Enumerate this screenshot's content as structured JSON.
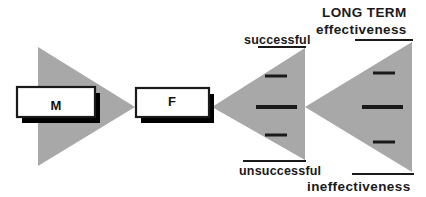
{
  "diagram": {
    "title": "",
    "background_color": "#ffffff",
    "fill_gray": "#a8a8a8",
    "outline_color": "#1a1a1a",
    "shadow_color": "#000000",
    "box_fill": "#ffffff",
    "nodes": [
      {
        "id": "m",
        "label": "M"
      },
      {
        "id": "f",
        "label": "F"
      }
    ],
    "labels": {
      "successful": "successful",
      "unsuccessful": "unsuccessful",
      "long_term": "LONG TERM",
      "effectiveness": "effectiveness",
      "ineffectiveness": "ineffectiveness"
    },
    "triangles": [
      {
        "id": "m-triangle",
        "direction": "right",
        "ticks": 0
      },
      {
        "id": "outcome-triangle",
        "direction": "left",
        "ticks": 3
      },
      {
        "id": "effectiveness-triangle",
        "direction": "left",
        "ticks": 3
      }
    ]
  }
}
